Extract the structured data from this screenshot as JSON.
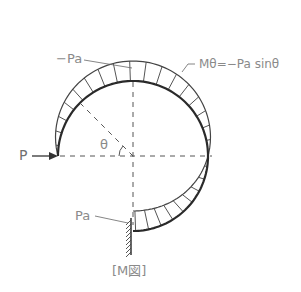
{
  "figure": {
    "caption": "[M図]",
    "labels": {
      "top_moment": "−Pa",
      "moment_formula": "Mθ=−Pa sinθ",
      "load": "P",
      "angle": "θ",
      "bottom_moment": "Pa"
    },
    "colors": {
      "stroke": "#3a3a3a",
      "hatch": "#555555",
      "dashed": "#555555",
      "label": "#8a8a8a"
    }
  }
}
